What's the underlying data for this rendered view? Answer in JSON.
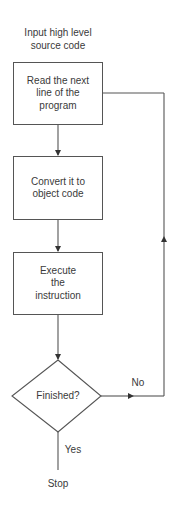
{
  "flowchart": {
    "start_label": "Input high level\nsource code",
    "steps": [
      {
        "label": "Read the next\nline of the\nprogram"
      },
      {
        "label": "Convert it to\nobject code"
      },
      {
        "label": "Execute\nthe\ninstruction"
      }
    ],
    "decision": {
      "label": "Finished?"
    },
    "branches": {
      "no_label": "No",
      "yes_label": "Yes"
    },
    "end_label": "Stop"
  },
  "colors": {
    "line": "#555555",
    "text": "#3a3a3a",
    "background": "#ffffff"
  }
}
